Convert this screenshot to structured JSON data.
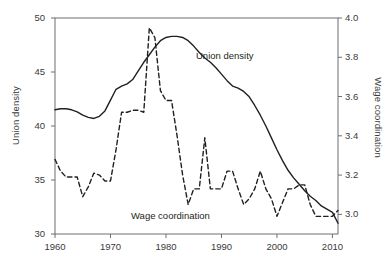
{
  "chart_data": {
    "type": "line",
    "title": "",
    "xlabel": "",
    "xlim": [
      1960,
      2011
    ],
    "xticks": [
      1960,
      1970,
      1980,
      1990,
      2000,
      2010
    ],
    "xtick_labels": [
      "1960",
      "1970",
      "1980",
      "1990",
      "2000",
      "2010"
    ],
    "grid": false,
    "legend_position": "inline-annotations",
    "axes": [
      {
        "id": "left",
        "label": "Union density",
        "ylim": [
          30,
          50
        ],
        "yticks": [
          30,
          35,
          40,
          45,
          50
        ],
        "ytick_labels": [
          "30",
          "35",
          "40",
          "45",
          "50"
        ]
      },
      {
        "id": "right",
        "label": "Wage coordination",
        "ylim": [
          2.9,
          4.0
        ],
        "yticks": [
          3.0,
          3.2,
          3.4,
          3.6,
          3.8,
          4.0
        ],
        "ytick_labels": [
          "3.0",
          "3.2",
          "3.4",
          "3.6",
          "3.8",
          "4.0"
        ]
      }
    ],
    "x": [
      1960,
      1961,
      1962,
      1963,
      1964,
      1965,
      1966,
      1967,
      1968,
      1969,
      1970,
      1971,
      1972,
      1973,
      1974,
      1975,
      1976,
      1977,
      1978,
      1979,
      1980,
      1981,
      1982,
      1983,
      1984,
      1985,
      1986,
      1987,
      1988,
      1989,
      1990,
      1991,
      1992,
      1993,
      1994,
      1995,
      1996,
      1997,
      1998,
      1999,
      2000,
      2001,
      2002,
      2003,
      2004,
      2005,
      2006,
      2007,
      2008,
      2009,
      2010,
      2011
    ],
    "series": [
      {
        "name": "Union density",
        "axis": "left",
        "style": "solid",
        "color": "#231f20",
        "annotation": "Union density",
        "values": [
          41.5,
          41.6,
          41.6,
          41.5,
          41.3,
          41.0,
          40.8,
          40.7,
          40.9,
          41.4,
          42.4,
          43.4,
          43.7,
          43.9,
          44.3,
          45.1,
          45.9,
          46.6,
          47.3,
          47.9,
          48.2,
          48.3,
          48.3,
          48.2,
          47.9,
          47.4,
          46.8,
          46.3,
          45.9,
          45.4,
          44.8,
          44.2,
          43.7,
          43.5,
          43.2,
          42.7,
          41.9,
          41.0,
          40.0,
          38.9,
          37.8,
          36.8,
          35.9,
          35.2,
          34.6,
          34.0,
          33.5,
          33.1,
          32.6,
          32.3,
          32.0,
          31.0
        ]
      },
      {
        "name": "Wage coordination",
        "axis": "right",
        "style": "dashed",
        "color": "#231f20",
        "annotation": "Wage coordination",
        "values": [
          3.28,
          3.22,
          3.19,
          3.19,
          3.19,
          3.09,
          3.14,
          3.21,
          3.2,
          3.17,
          3.17,
          3.33,
          3.52,
          3.52,
          3.53,
          3.53,
          3.52,
          3.95,
          3.9,
          3.63,
          3.58,
          3.58,
          3.4,
          3.2,
          3.05,
          3.13,
          3.13,
          3.39,
          3.13,
          3.13,
          3.13,
          3.22,
          3.22,
          3.13,
          3.05,
          3.08,
          3.13,
          3.22,
          3.13,
          3.08,
          2.99,
          3.06,
          3.13,
          3.13,
          3.15,
          3.15,
          3.05,
          2.99,
          2.99,
          2.99,
          2.99,
          3.02
        ]
      }
    ]
  },
  "axis_titles": {
    "left": "Union density",
    "right": "Wage coordination"
  },
  "annotations": {
    "union_density": "Union density",
    "wage_coordination": "Wage coordination"
  },
  "colors": {
    "line": "#231f20",
    "axis": "#6d6e71",
    "text": "#3a3a3a",
    "background": "#ffffff"
  }
}
